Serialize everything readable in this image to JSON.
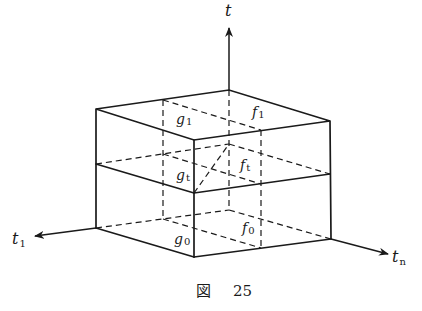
{
  "figure": {
    "caption_prefix": "図",
    "caption_number": "25",
    "axes": [
      {
        "id": "t",
        "base": "t",
        "sub": ""
      },
      {
        "id": "t1",
        "base": "t",
        "sub": "1"
      },
      {
        "id": "tn",
        "base": "t",
        "sub": "n"
      }
    ],
    "labels": {
      "g1": {
        "base": "g",
        "sub": "1"
      },
      "f1": {
        "base": "f",
        "sub": "1"
      },
      "gt": {
        "base": "g",
        "sub": "t"
      },
      "ft": {
        "base": "f",
        "sub": "t"
      },
      "g0": {
        "base": "g",
        "sub": "0"
      },
      "f0": {
        "base": "f",
        "sub": "0"
      }
    }
  }
}
